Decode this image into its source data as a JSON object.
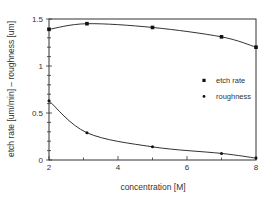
{
  "chart_data": {
    "type": "scatter",
    "title": "",
    "xlabel": "concentration [M]",
    "ylabel": "etch rate [um/min] – roughness [um]",
    "xlim": [
      2,
      8
    ],
    "ylim": [
      0,
      1.5
    ],
    "x_ticks": [
      2,
      4,
      6,
      8
    ],
    "x_tick_labels": [
      "2",
      "4",
      "6",
      "8"
    ],
    "y_ticks": [
      0,
      0.5,
      1,
      1.5
    ],
    "y_tick_labels": [
      "0",
      "0.5",
      "1",
      "1.5"
    ],
    "grid": false,
    "legend_position": "right-middle",
    "series": [
      {
        "name": "etch rate",
        "marker": "square",
        "x": [
          2,
          3.1,
          5,
          7,
          8
        ],
        "values": [
          1.39,
          1.45,
          1.41,
          1.31,
          1.2
        ],
        "fit_curve": true
      },
      {
        "name": "roughness",
        "marker": "dot",
        "x": [
          2,
          3.1,
          5,
          7,
          8
        ],
        "values": [
          0.63,
          0.29,
          0.14,
          0.07,
          0.02
        ],
        "fit_curve": true
      }
    ]
  }
}
